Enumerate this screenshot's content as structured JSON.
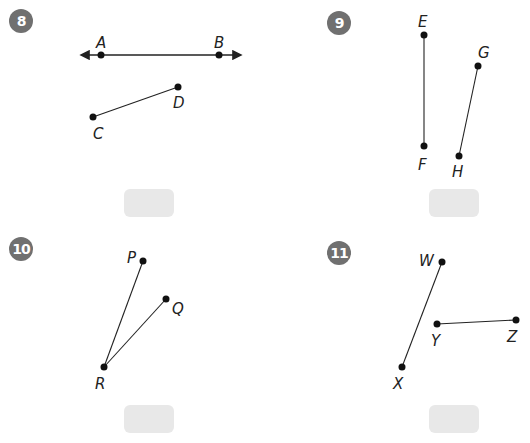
{
  "problems": [
    {
      "number": "8",
      "badge_color": "#707070",
      "figures": [
        {
          "type": "line",
          "points": [
            "A",
            "B"
          ]
        },
        {
          "type": "segment",
          "points": [
            "C",
            "D"
          ]
        }
      ],
      "labels": {
        "A": "A",
        "B": "B",
        "C": "C",
        "D": "D"
      },
      "answer": ""
    },
    {
      "number": "9",
      "badge_color": "#707070",
      "figures": [
        {
          "type": "segment",
          "points": [
            "E",
            "F"
          ]
        },
        {
          "type": "segment",
          "points": [
            "G",
            "H"
          ]
        }
      ],
      "labels": {
        "E": "E",
        "F": "F",
        "G": "G",
        "H": "H"
      },
      "answer": ""
    },
    {
      "number": "10",
      "badge_color": "#707070",
      "figures": [
        {
          "type": "segment",
          "points": [
            "R",
            "P"
          ]
        },
        {
          "type": "segment",
          "points": [
            "R",
            "Q"
          ]
        }
      ],
      "labels": {
        "P": "P",
        "Q": "Q",
        "R": "R"
      },
      "answer": ""
    },
    {
      "number": "11",
      "badge_color": "#707070",
      "figures": [
        {
          "type": "segment",
          "points": [
            "W",
            "X"
          ]
        },
        {
          "type": "segment",
          "points": [
            "Y",
            "Z"
          ]
        }
      ],
      "labels": {
        "W": "W",
        "X": "X",
        "Y": "Y",
        "Z": "Z"
      },
      "answer": ""
    }
  ],
  "answer_box_color": "#e8e8e8"
}
